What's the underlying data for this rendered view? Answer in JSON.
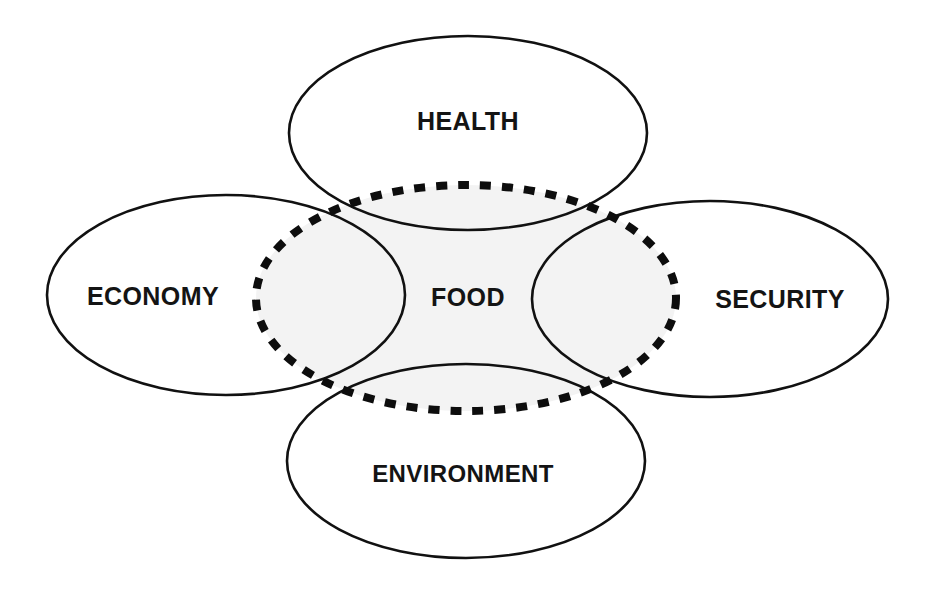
{
  "diagram": {
    "type": "venn",
    "canvas": {
      "width": 928,
      "height": 592
    },
    "background_color": "#ffffff",
    "outline_color": "#111111",
    "dashed_outline_color": "#0d0d0d",
    "center_fill_color": "#f3f3f3",
    "label_color": "#141414",
    "nodes": [
      {
        "id": "health",
        "label": "HEALTH",
        "shape": "ellipse",
        "stroke": "solid",
        "cx": 468,
        "cy": 133,
        "rx": 179,
        "ry": 97,
        "label_x": 468,
        "label_y": 121
      },
      {
        "id": "economy",
        "label": "ECONOMY",
        "shape": "ellipse",
        "stroke": "solid",
        "cx": 226,
        "cy": 295,
        "rx": 179,
        "ry": 100,
        "label_x": 153,
        "label_y": 296
      },
      {
        "id": "security",
        "label": "SECURITY",
        "shape": "ellipse",
        "stroke": "solid",
        "cx": 710,
        "cy": 299,
        "rx": 178,
        "ry": 98,
        "label_x": 780,
        "label_y": 299
      },
      {
        "id": "environment",
        "label": "ENVIRONMENT",
        "shape": "ellipse",
        "stroke": "solid",
        "cx": 466,
        "cy": 461,
        "rx": 179,
        "ry": 97,
        "label_x": 463,
        "label_y": 473
      },
      {
        "id": "food",
        "label": "FOOD",
        "shape": "ellipse",
        "stroke": "dashed",
        "cx": 466,
        "cy": 298,
        "rx": 210,
        "ry": 113,
        "label_x": 468,
        "label_y": 297
      }
    ]
  }
}
